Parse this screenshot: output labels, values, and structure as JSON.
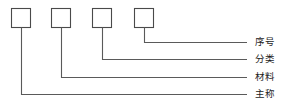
{
  "diagram": {
    "type": "callout-structure-diagram",
    "canvas": {
      "width": 284,
      "height": 109
    },
    "style": {
      "box_stroke_color": "#4a4a4a",
      "line_stroke_color": "#5a5a5a",
      "box_fill_color": "#ffffff",
      "background_color": "#ffffff",
      "text_color": "#1c1c1c"
    },
    "boxes": [
      {
        "id": "box-1",
        "x": 11,
        "y": 8,
        "width": 20,
        "height": 20,
        "value": ""
      },
      {
        "id": "box-2",
        "x": 51,
        "y": 8,
        "width": 20,
        "height": 20,
        "value": ""
      },
      {
        "id": "box-3",
        "x": 92,
        "y": 8,
        "width": 20,
        "height": 20,
        "value": ""
      },
      {
        "id": "box-4",
        "x": 134,
        "y": 8,
        "width": 20,
        "height": 20,
        "value": ""
      }
    ],
    "callouts": [
      {
        "id": "callout-xuhao",
        "label": "序号",
        "from_box": "box-4",
        "stem_x": 144,
        "elbow_y": 42,
        "line_end_x": 247,
        "label_x": 255
      },
      {
        "id": "callout-fenlei",
        "label": "分类",
        "from_box": "box-3",
        "stem_x": 102,
        "elbow_y": 59,
        "line_end_x": 247,
        "label_x": 255
      },
      {
        "id": "callout-cailiao",
        "label": "材料",
        "from_box": "box-2",
        "stem_x": 61,
        "elbow_y": 77,
        "line_end_x": 247,
        "label_x": 255
      },
      {
        "id": "callout-zhucheng",
        "label": "主称",
        "from_box": "box-1",
        "stem_x": 21,
        "elbow_y": 94,
        "line_end_x": 247,
        "label_x": 255
      }
    ]
  }
}
